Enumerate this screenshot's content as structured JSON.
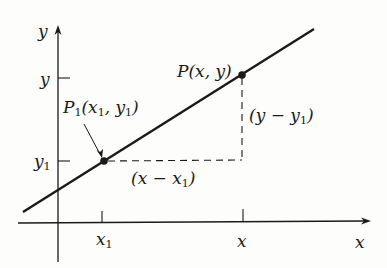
{
  "diagram": {
    "axes": {
      "x_label": "x",
      "y_label": "y"
    },
    "points": [
      {
        "name": "P1",
        "label": "P",
        "sub": "1",
        "coords_text": "(x",
        "coords_sub1": "1",
        "coords_mid": ", y",
        "coords_sub2": "1",
        "coords_end": ")"
      },
      {
        "name": "P",
        "label": "P(x, y)"
      }
    ],
    "ticks": {
      "x1": {
        "label": "x",
        "sub": "1"
      },
      "x": {
        "label": "x"
      },
      "y": {
        "label": "y"
      },
      "y1": {
        "label": "y",
        "sub": "1"
      }
    },
    "segments": {
      "run": {
        "pre": "(x − x",
        "sub": "1",
        "post": ")"
      },
      "rise": {
        "pre": "(y − y",
        "sub": "1",
        "post": ")"
      }
    },
    "colors": {
      "ink": "#1a1a1a",
      "background": "#fdfdfb"
    }
  }
}
